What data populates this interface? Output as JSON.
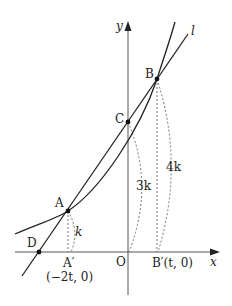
{
  "diagram": {
    "axes": {
      "x_label": "x",
      "y_label": "y",
      "origin_label": "O"
    },
    "line": {
      "label": "l"
    },
    "points": {
      "A": {
        "label": "A"
      },
      "B": {
        "label": "B"
      },
      "C": {
        "label": "C"
      },
      "D": {
        "label": "D"
      },
      "A_prime": {
        "label": "A′",
        "coord": "(−2t, 0)"
      },
      "B_prime": {
        "label": "B′(t, 0)"
      }
    },
    "arc_labels": {
      "A_height": "k",
      "C_height": "3k",
      "B_height": "4k"
    },
    "colors": {
      "stroke": "#222222",
      "axis": "#555555",
      "dashed": "#666666",
      "background": "#ffffff"
    }
  }
}
